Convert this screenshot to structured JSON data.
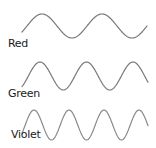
{
  "title": "",
  "waves": [
    {
      "label": "Red",
      "stroke": "#777777",
      "label_x": 8,
      "label_y": 38,
      "x_start": 22,
      "x_end": 147,
      "center_y": 26,
      "amplitude": 12,
      "wavelength": 60,
      "phase_peak_x": 42
    },
    {
      "label": "Green",
      "stroke": "#7a7a7a",
      "label_x": 8,
      "label_y": 88,
      "x_start": 22,
      "x_end": 148,
      "center_y": 76,
      "amplitude": 14,
      "wavelength": 46.5,
      "phase_peak_x": 40
    },
    {
      "label": "Violet",
      "stroke": "#8a8a8a",
      "label_x": 11,
      "label_y": 129,
      "x_start": 22,
      "x_end": 148,
      "center_y": 125,
      "amplitude": 15,
      "wavelength": 35,
      "phase_peak_x": 34
    }
  ]
}
